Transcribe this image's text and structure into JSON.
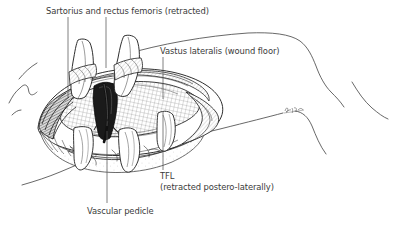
{
  "figure": {
    "kind": "surgical-anatomical-line-illustration",
    "background_color": "#ffffff",
    "ink_color": "#2b2b2b",
    "text_color": "#3a3a3a",
    "leader_line_color": "#555555",
    "shade_color": "#6f6f6f",
    "artist_signature": "Kar"
  },
  "labels": [
    {
      "id": "sartorius",
      "text": "Sartorius and rectus femoris (retracted)",
      "leaders": 2
    },
    {
      "id": "vastus",
      "text": "Vastus lateralis (wound floor)",
      "leaders": 1
    },
    {
      "id": "tfl",
      "line1": "TFL",
      "line2": "(retracted postero-laterally)",
      "leaders": 1
    },
    {
      "id": "pedicle",
      "text": "Vascular pedicle",
      "leaders": 1
    }
  ],
  "structures": [
    "skin-outline-thigh",
    "wound-cavity",
    "vastus-lateralis-muscle-floor",
    "sartorius-muscle-retracted",
    "rectus-femoris-muscle-retracted",
    "tensor-fasciae-latae-retracted",
    "vascular-pedicle",
    "retractor-blade",
    "subcutaneous-fat-vessels"
  ]
}
